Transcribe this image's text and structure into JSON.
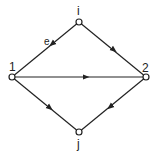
{
  "diagram": {
    "type": "directed-graph",
    "nodes": [
      {
        "id": "i",
        "label": "i",
        "x": 79,
        "y": 22
      },
      {
        "id": "1",
        "label": "1",
        "x": 12,
        "y": 77
      },
      {
        "id": "2",
        "label": "2",
        "x": 146,
        "y": 77
      },
      {
        "id": "j",
        "label": "j",
        "x": 79,
        "y": 132
      }
    ],
    "edges": [
      {
        "from": "i",
        "to": "1",
        "label": "e"
      },
      {
        "from": "i",
        "to": "2",
        "label": ""
      },
      {
        "from": "1",
        "to": "2",
        "label": ""
      },
      {
        "from": "1",
        "to": "j",
        "label": ""
      },
      {
        "from": "2",
        "to": "j",
        "label": ""
      }
    ],
    "colors": {
      "stroke": "#222222",
      "node_fill": "#ffffff"
    }
  }
}
